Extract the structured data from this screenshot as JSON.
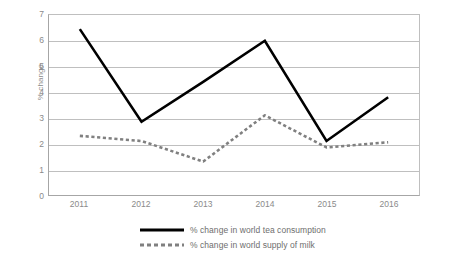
{
  "chart_data": {
    "type": "line",
    "title": "",
    "subtitle": "",
    "xlabel": "",
    "ylabel": "% change",
    "categories": [
      "2011",
      "2012",
      "2013",
      "2014",
      "2015",
      "2016"
    ],
    "ylim": [
      0,
      7
    ],
    "yticks": [
      0,
      1,
      2,
      3,
      4,
      5,
      6,
      7
    ],
    "ytick_labels": [
      "0",
      "1",
      "2",
      "3",
      "4",
      "5",
      "6",
      "7"
    ],
    "grid": true,
    "legend_position": "bottom",
    "series": [
      {
        "name": "% change in world tea consumption",
        "style": "solid",
        "color": "#000000",
        "values": [
          6.45,
          2.85,
          4.4,
          6.0,
          2.1,
          3.8
        ]
      },
      {
        "name": "% change in world supply of milk",
        "style": "dotted",
        "color": "#808080",
        "values": [
          2.3,
          2.1,
          1.3,
          3.1,
          1.85,
          2.05
        ]
      }
    ]
  },
  "legend": {
    "items": [
      {
        "label": "% change in world tea consumption",
        "swatch": "solid-line-swatch"
      },
      {
        "label": "% change in world supply of milk",
        "swatch": "dotted-line-swatch"
      }
    ]
  },
  "colors": {
    "tea_line": "#000000",
    "milk_line": "#808080",
    "gridline": "#bfbfbf",
    "axis": "#a6a6a6",
    "text": "#8a8a8a",
    "background": "#ffffff"
  }
}
